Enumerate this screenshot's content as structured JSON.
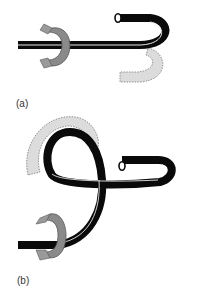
{
  "figure": {
    "panels": [
      {
        "id": "a",
        "label": "(a)",
        "description": "Straight tube with rotation clamp; free end curls into a hook with dashed grey ghost hook below"
      },
      {
        "id": "b",
        "label": "(b)",
        "description": "Tube forms a full loop after rotation; dashed grey ghost arc shown behind loop, rotation clamp at bottom-left"
      }
    ],
    "colors": {
      "tube": "#0a0a0a",
      "tube_highlight": "#e8e8e8",
      "clamp": "#8a8a8a",
      "clamp_dark": "#555555",
      "ghost_fill": "#dcdcdc",
      "ghost_stroke": "#7a7a7a",
      "background": "#ffffff"
    }
  }
}
